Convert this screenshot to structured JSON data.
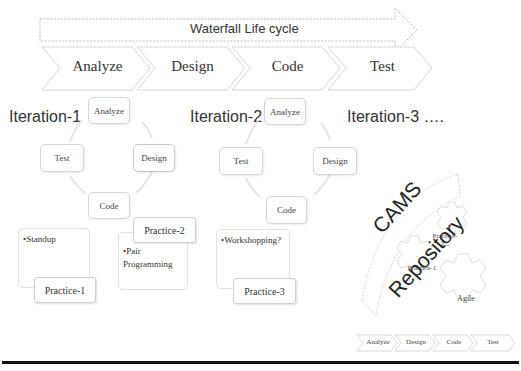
{
  "waterfall": {
    "title": "Waterfall Life cycle",
    "phases": [
      "Analyze",
      "Design",
      "Code",
      "Test"
    ]
  },
  "iterations": [
    {
      "label": "Iteration-1",
      "cycle": [
        "Analyze",
        "Design",
        "Code",
        "Test"
      ],
      "practices": [
        {
          "tag": "Practice-1",
          "items": [
            "•Standup"
          ]
        },
        {
          "tag": "Practice-2",
          "items": [
            "•Pair Programming"
          ]
        }
      ]
    },
    {
      "label": "Iteration-2",
      "cycle": [
        "Analyze",
        "Design",
        "Code",
        "Test"
      ],
      "practices": [
        {
          "tag": "Practice-3",
          "items": [
            "•Workshopping?"
          ]
        }
      ]
    },
    {
      "label": "Iteration-3 …."
    }
  ],
  "repository": {
    "title_line1": "CAMS",
    "title_line2": "Repository",
    "gears": [
      "Practice-2...",
      "Practice-1",
      "Agile"
    ]
  },
  "mini_flow": [
    "Analyze",
    "Design",
    "Code",
    "Test"
  ]
}
